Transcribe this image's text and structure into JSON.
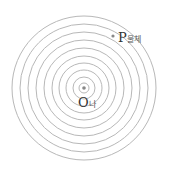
{
  "diagram": {
    "type": "concentric-circles",
    "center": {
      "x": 84,
      "y": 88
    },
    "ring_radii": [
      5,
      11,
      18,
      25,
      32,
      40,
      48,
      56,
      64,
      72
    ],
    "ring_color": "#b8b8b8",
    "dot_color": "#888888",
    "labels": {
      "center_letter": "O",
      "center_suffix": "나",
      "point_letter": "P",
      "point_suffix": "물체"
    }
  }
}
